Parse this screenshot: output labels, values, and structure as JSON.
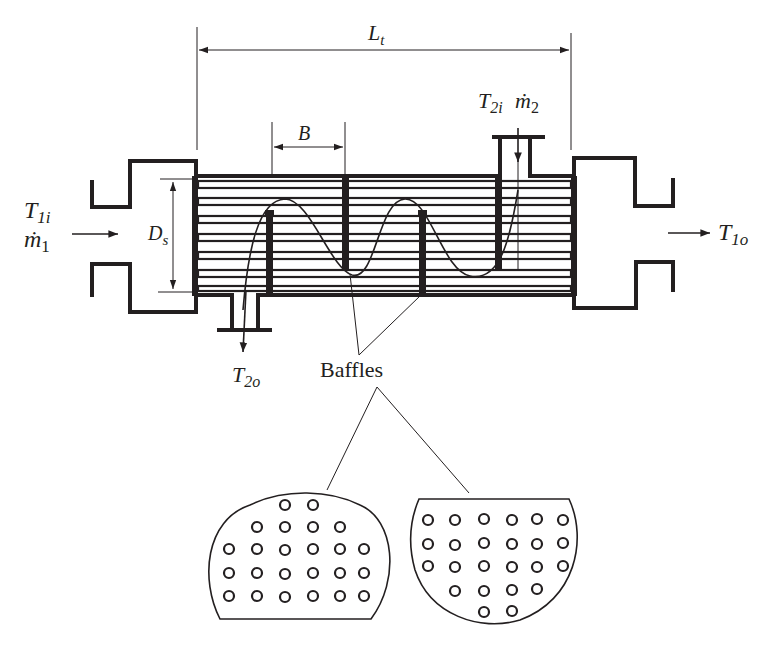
{
  "diagram": {
    "type": "shell-and-tube heat exchanger schematic",
    "labels": {
      "tube_length": {
        "main": "L",
        "sub": "t"
      },
      "baffle_spacing": "B",
      "shell_diameter": {
        "main": "D",
        "sub": "s"
      },
      "tube_inlet_temp": {
        "main": "T",
        "sub": "1i"
      },
      "tube_inlet_flow": {
        "main": "ṁ",
        "sub": "1"
      },
      "tube_outlet_temp": {
        "main": "T",
        "sub": "1o"
      },
      "shell_inlet_temp": {
        "main": "T",
        "sub": "2i"
      },
      "shell_inlet_flow": {
        "main": "ṁ",
        "sub": "2"
      },
      "shell_outlet_temp": {
        "main": "T",
        "sub": "2o"
      },
      "baffles": "Baffles"
    },
    "tube_rows": 6,
    "baffle_count": 3,
    "baffle_details": [
      {
        "name": "left-baffle-cross-section",
        "cut": "bottom",
        "hole_rows": [
          2,
          4,
          6,
          6,
          6
        ]
      },
      {
        "name": "right-baffle-cross-section",
        "cut": "top",
        "hole_rows": [
          6,
          6,
          6,
          4,
          2
        ]
      }
    ],
    "colors": {
      "ink": "#231f20",
      "background": "#ffffff"
    }
  }
}
